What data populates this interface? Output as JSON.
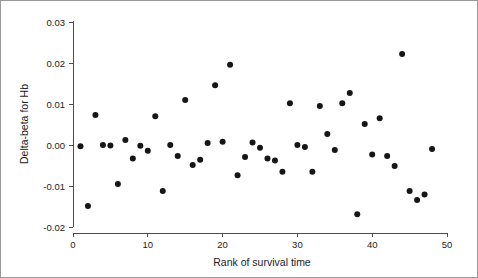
{
  "chart_data": {
    "type": "scatter",
    "title": "",
    "xlabel": "Rank of survival time",
    "ylabel": "Delta-beta for Hb",
    "xlim": [
      0,
      50
    ],
    "ylim": [
      -0.02,
      0.03
    ],
    "xticks": [
      0,
      10,
      20,
      30,
      40,
      50
    ],
    "xtick_labels": [
      "0",
      "10",
      "20",
      "30",
      "40",
      "50"
    ],
    "yticks": [
      -0.02,
      -0.01,
      0.0,
      0.01,
      0.02,
      0.03
    ],
    "ytick_labels": [
      "-0.02",
      "-0.01",
      "0.00",
      "0.01",
      "0.02",
      "0.03"
    ],
    "grid": false,
    "legend": null,
    "marker": "filled-circle",
    "marker_color": "#161616",
    "marker_size": 3,
    "n_points": 48,
    "x": [
      1,
      2,
      3,
      4,
      5,
      6,
      7,
      8,
      9,
      10,
      11,
      12,
      13,
      14,
      15,
      16,
      17,
      18,
      19,
      20,
      21,
      22,
      23,
      24,
      25,
      26,
      27,
      28,
      29,
      30,
      31,
      32,
      33,
      34,
      35,
      36,
      37,
      38,
      39,
      40,
      41,
      42,
      43,
      44,
      45,
      46,
      47,
      48
    ],
    "y": [
      -0.0003,
      -0.0149,
      0.0073,
      0.0,
      -0.0001,
      -0.0095,
      0.0012,
      -0.0033,
      -0.0002,
      -0.0014,
      0.007,
      -0.0112,
      0.0,
      -0.0027,
      0.011,
      -0.0049,
      -0.0036,
      0.0005,
      0.0146,
      0.0008,
      0.0196,
      -0.0074,
      -0.0029,
      0.0006,
      -0.0007,
      -0.0033,
      -0.0038,
      -0.0065,
      0.0102,
      0.0,
      -0.0005,
      -0.0065,
      0.0095,
      0.0027,
      -0.0012,
      0.0102,
      0.0127,
      -0.0169,
      0.0051,
      -0.0023,
      0.0065,
      -0.0027,
      -0.0051,
      0.0222,
      -0.0112,
      -0.0134,
      -0.0121,
      -0.001
    ]
  }
}
